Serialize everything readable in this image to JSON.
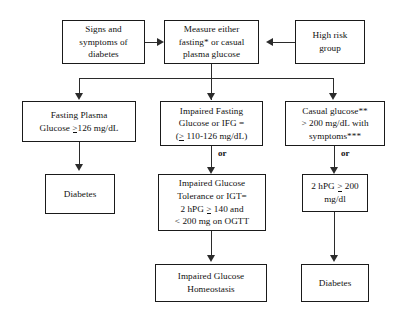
{
  "diagram": {
    "nodes": {
      "signs_symptoms": {
        "lines": [
          "Signs and",
          "symptoms of",
          "diabetes"
        ]
      },
      "measure_glucose": {
        "lines": [
          "Measure either",
          "fasting* or casual",
          "plasma glucose"
        ]
      },
      "high_risk": {
        "lines": [
          "High risk",
          "group"
        ]
      },
      "fasting_plasma": {
        "lines": [
          "Fasting Plasma",
          "Glucose ≥126 mg/dL"
        ]
      },
      "impaired_fasting": {
        "lines": [
          "Impaired Fasting",
          "Glucose or IFG =",
          "(≥ 110-126 mg/dL)"
        ]
      },
      "casual_glucose": {
        "lines": [
          "Casual glucose**",
          "> 200 mg/dL with",
          "symptoms***"
        ]
      },
      "diabetes_left": {
        "lines": [
          "Diabetes"
        ]
      },
      "impaired_tolerance": {
        "lines": [
          "Impaired Glucose",
          "Tolerance or IGT=",
          "2 hPG ≥ 140 and",
          "< 200 mg on OGTT"
        ]
      },
      "two_hpg": {
        "lines": [
          "2 hPG ≥ 200",
          "mg/dl"
        ]
      },
      "impaired_homeostasis": {
        "lines": [
          "Impaired Glucose",
          "Homeostasis"
        ]
      },
      "diabetes_right": {
        "lines": [
          "Diabetes"
        ]
      }
    },
    "connector_labels": {
      "or_middle": "or",
      "or_right": "or"
    },
    "colors": {
      "background": "#ffffff",
      "box_border": "#1a1a1a",
      "connector": "#2b2b2b",
      "text": "#111111"
    }
  }
}
